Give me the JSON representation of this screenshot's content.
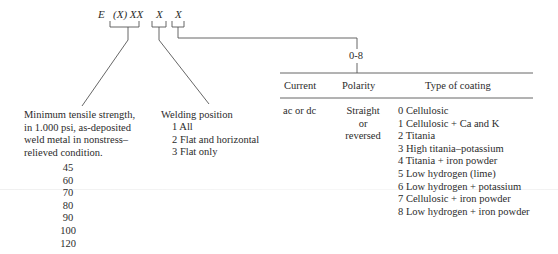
{
  "formula": {
    "e": "E",
    "strength": "(X) XX",
    "position": "X",
    "coating": "X"
  },
  "tensile": {
    "description_lines": [
      "Minimum tensile strength,",
      "in 1.000 psi, as-deposited",
      "weld metal in nonstress–",
      "relieved condition."
    ],
    "values": [
      "45",
      "60",
      "70",
      "80",
      "90",
      "100",
      "120"
    ]
  },
  "welding_position": {
    "title": "Welding position",
    "items": [
      "1 All",
      "2 Flat and horizontal",
      "3 Flat only"
    ]
  },
  "coating_table": {
    "range_label": "0-8",
    "headers": {
      "current": "Current",
      "polarity": "Polarity",
      "coating": "Type of coating"
    },
    "current": "ac or dc",
    "polarity_lines": [
      "Straight",
      "or",
      "reversed"
    ],
    "coatings": [
      "0 Cellulosic",
      "1 Cellulosic + Ca and K",
      "2 Titania",
      "3 High titania–potassium",
      "4 Titania + iron powder",
      "5 Low hydrogen (lime)",
      "6 Low hydrogen + potassium",
      "7 Cellulosic + iron powder",
      "8 Low hydrogen + iron powder"
    ]
  }
}
